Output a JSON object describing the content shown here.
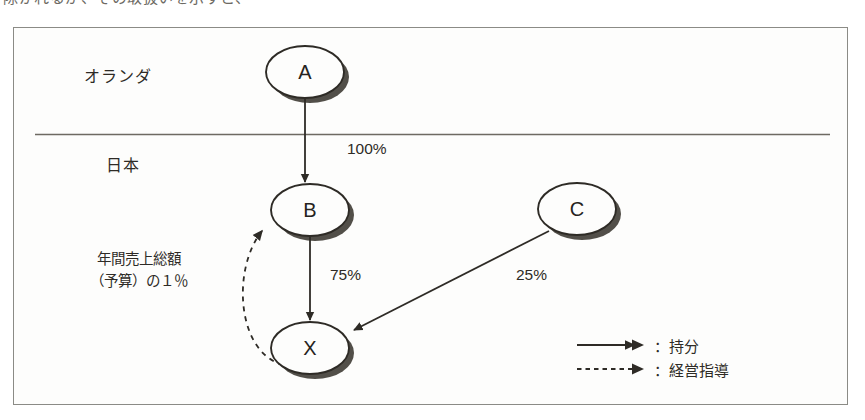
{
  "page": {
    "clipped_top_line": "除かれるが、その取扱いを示すと、"
  },
  "figure": {
    "regions": [
      {
        "id": "netherlands",
        "label": "オランダ"
      },
      {
        "id": "japan",
        "label": "日本"
      }
    ],
    "nodes": [
      {
        "id": "A",
        "label": "A",
        "region": "netherlands",
        "cx": 305,
        "cy": 72,
        "rx": 39,
        "ry": 26
      },
      {
        "id": "B",
        "label": "B",
        "region": "japan",
        "cx": 310,
        "cy": 210,
        "rx": 39,
        "ry": 26
      },
      {
        "id": "C",
        "label": "C",
        "region": "japan",
        "cx": 577,
        "cy": 209,
        "rx": 39,
        "ry": 26
      },
      {
        "id": "X",
        "label": "X",
        "region": "japan",
        "cx": 310,
        "cy": 348,
        "rx": 39,
        "ry": 26
      }
    ],
    "edges": [
      {
        "id": "a-to-b",
        "from": "A",
        "to": "B",
        "label": "100%",
        "style": "solid"
      },
      {
        "id": "b-to-x",
        "from": "B",
        "to": "X",
        "label": "75%",
        "style": "solid"
      },
      {
        "id": "c-to-x",
        "from": "C",
        "to": "X",
        "label": "25%",
        "style": "solid"
      },
      {
        "id": "x-to-b",
        "from": "X",
        "to": "B",
        "label": "年間売上総額（予算）の１％",
        "style": "dashed"
      }
    ],
    "annotation": {
      "line1": "年間売上総額",
      "line2": "（予算）の１％"
    },
    "legend": {
      "items": [
        {
          "id": "solid",
          "style": "solid",
          "label": "：持分"
        },
        {
          "id": "dashed",
          "style": "dashed",
          "label": "：経営指導"
        }
      ]
    },
    "colors": {
      "line": "#2e2b26",
      "frame": "#8b8b86",
      "shadow": "#3a3730",
      "background": "#fdfdfc",
      "text": "#2e2b26"
    }
  }
}
